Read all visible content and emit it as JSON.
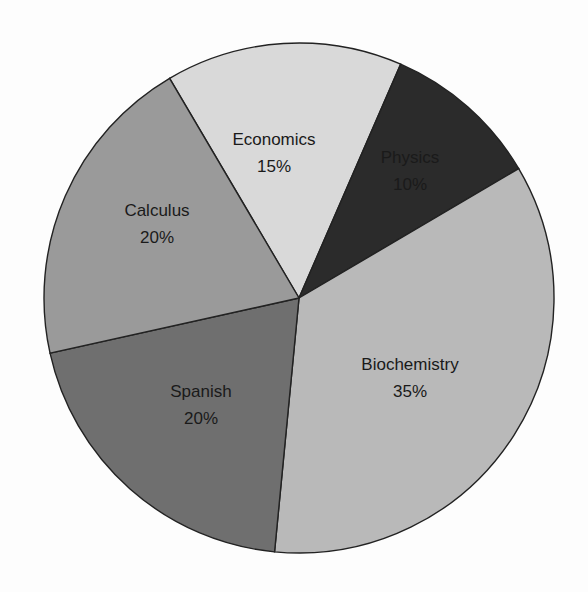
{
  "chart_data": {
    "type": "pie",
    "title": "",
    "center": [
      299,
      298
    ],
    "radius": 255,
    "start_angle_deg": 239.5,
    "direction": "clockwise",
    "legend": "none (labels inside slices)",
    "slices": [
      {
        "label": "Economics",
        "value": 15,
        "value_label": "15%",
        "color": "#d9d9d9",
        "text_pos": [
          274,
          145
        ]
      },
      {
        "label": "Physics",
        "value": 10,
        "value_label": "10%",
        "color": "#2b2b2b",
        "text_pos": [
          410,
          163
        ]
      },
      {
        "label": "Biochemistry",
        "value": 35,
        "value_label": "35%",
        "color": "#b9b9b9",
        "text_pos": [
          410,
          370
        ]
      },
      {
        "label": "Spanish",
        "value": 20,
        "value_label": "20%",
        "color": "#6f6f6f",
        "text_pos": [
          201,
          397
        ]
      },
      {
        "label": "Calculus",
        "value": 20,
        "value_label": "20%",
        "color": "#9a9a9a",
        "text_pos": [
          157,
          216
        ]
      }
    ],
    "categories": [
      "Economics",
      "Physics",
      "Biochemistry",
      "Spanish",
      "Calculus"
    ],
    "values": [
      15,
      10,
      35,
      20,
      20
    ]
  }
}
